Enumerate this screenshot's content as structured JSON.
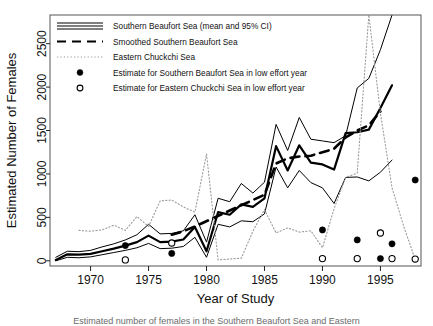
{
  "figure": {
    "title": "",
    "caption_fragment": "Estimated number of females in the Southern Beaufort Sea and Eastern"
  },
  "axes": {
    "xlabel": "Year of Study",
    "ylabel": "Estimated Number of Females",
    "xticks": [
      "1970",
      "1975",
      "1980",
      "1985",
      "1990",
      "1995"
    ],
    "yticks": [
      "0",
      "500",
      "1000",
      "1500",
      "2000",
      "2500"
    ]
  },
  "legend": {
    "items": [
      {
        "label": "Southern Beaufort Sea (mean and 95% CI)",
        "marker": "triple-solid-line",
        "color": "#000000"
      },
      {
        "label": "Smoothed Southern Beaufort Sea",
        "marker": "dashed-line",
        "color": "#000000"
      },
      {
        "label": "Eastern Chuckchi Sea",
        "marker": "dotted-line",
        "color": "#9a9a9a"
      },
      {
        "label": "Estimate for Southern Beaufort Sea in low effort year",
        "marker": "filled-circle",
        "color": "#000000"
      },
      {
        "label": "Estimate for Eastern Chuckchi Sea in low effort year",
        "marker": "open-circle",
        "color": "#000000"
      }
    ]
  },
  "chart_data": {
    "type": "line",
    "title": "",
    "xlabel": "Year of Study",
    "ylabel": "Estimated Number of Females",
    "xlim": [
      1966.5,
      1998.5
    ],
    "ylim": [
      -60,
      2830
    ],
    "xticks": [
      1970,
      1975,
      1980,
      1985,
      1990,
      1995
    ],
    "yticks": [
      0,
      500,
      1000,
      1500,
      2000,
      2500
    ],
    "grid": false,
    "legend_position": "top-left inside",
    "series": [
      {
        "name": "Southern Beaufort Sea (mean)",
        "style": "solid",
        "width": 2.2,
        "color": "#000000",
        "x": [
          1967,
          1968,
          1969,
          1970,
          1971,
          1972,
          1973,
          1974,
          1975,
          1976,
          1977,
          1978,
          1979,
          1980,
          1981,
          1982,
          1983,
          1984,
          1985,
          1986,
          1987,
          1988,
          1989,
          1990,
          1991,
          1992,
          1993,
          1994,
          1995,
          1996
        ],
        "values": [
          10,
          75,
          70,
          80,
          110,
          140,
          175,
          215,
          290,
          215,
          220,
          245,
          390,
          110,
          560,
          530,
          650,
          620,
          720,
          1320,
          1040,
          1330,
          1130,
          1110,
          1050,
          1470,
          1480,
          1510,
          1760,
          2020
        ]
      },
      {
        "name": "Southern Beaufort Sea (upper 95% CI)",
        "style": "solid",
        "width": 1,
        "color": "#000000",
        "x": [
          1967,
          1968,
          1969,
          1970,
          1971,
          1972,
          1973,
          1974,
          1975,
          1976,
          1977,
          1978,
          1979,
          1980,
          1981,
          1982,
          1983,
          1984,
          1985,
          1986,
          1987,
          1988,
          1989,
          1990,
          1991,
          1992,
          1993,
          1994,
          1995,
          1996
        ],
        "values": [
          40,
          110,
          105,
          120,
          160,
          195,
          240,
          300,
          420,
          310,
          315,
          345,
          530,
          215,
          720,
          680,
          890,
          780,
          905,
          1570,
          1270,
          1650,
          1400,
          1380,
          1360,
          1440,
          1990,
          2100,
          2430,
          2830
        ]
      },
      {
        "name": "Southern Beaufort Sea (lower 95% CI)",
        "style": "solid",
        "width": 1,
        "color": "#000000",
        "x": [
          1967,
          1968,
          1969,
          1970,
          1971,
          1972,
          1973,
          1974,
          1975,
          1976,
          1977,
          1978,
          1979,
          1980,
          1981,
          1982,
          1983,
          1984,
          1985,
          1986,
          1987,
          1988,
          1989,
          1990,
          1991,
          1992,
          1993,
          1994,
          1995,
          1996
        ],
        "values": [
          0,
          40,
          35,
          45,
          70,
          95,
          120,
          150,
          200,
          140,
          145,
          165,
          270,
          40,
          420,
          390,
          460,
          450,
          540,
          1080,
          840,
          1040,
          900,
          840,
          660,
          960,
          965,
          920,
          1020,
          1160
        ]
      },
      {
        "name": "Smoothed Southern Beaufort Sea",
        "style": "dashed",
        "width": 2.6,
        "color": "#000000",
        "x": [
          1977,
          1978,
          1979,
          1984,
          1985,
          1986,
          1987,
          1988,
          1989,
          1990,
          1991,
          1992,
          1993,
          1994,
          1995
        ],
        "values": [
          300,
          340,
          395,
          700,
          760,
          1120,
          1180,
          1200,
          1210,
          1250,
          1290,
          1420,
          1500,
          1560,
          1720
        ]
      },
      {
        "name": "Eastern Chuckchi Sea",
        "style": "dotted",
        "width": 1.1,
        "color": "#9a9a9a",
        "x": [
          1969,
          1970,
          1971,
          1972,
          1973,
          1974,
          1975,
          1976,
          1977,
          1978,
          1979,
          1980,
          1981,
          1982,
          1983,
          1984,
          1985,
          1986,
          1987,
          1988,
          1989,
          1990,
          1991,
          1992,
          1993,
          1994,
          1995,
          1996,
          1997,
          1998
        ],
        "values": [
          350,
          340,
          355,
          410,
          350,
          510,
          395,
          690,
          700,
          620,
          560,
          1230,
          10,
          20,
          30,
          340,
          590,
          320,
          380,
          330,
          345,
          150,
          600,
          960,
          1010,
          2830,
          1700,
          840,
          400,
          15
        ]
      }
    ],
    "points": [
      {
        "series": "Estimate for Southern Beaufort Sea in low effort year",
        "marker": "filled-circle",
        "x": 1973,
        "y": 175
      },
      {
        "series": "Estimate for Southern Beaufort Sea in low effort year",
        "marker": "filled-circle",
        "x": 1977,
        "y": 85
      },
      {
        "series": "Estimate for Southern Beaufort Sea in low effort year",
        "marker": "filled-circle",
        "x": 1990,
        "y": 355
      },
      {
        "series": "Estimate for Southern Beaufort Sea in low effort year",
        "marker": "filled-circle",
        "x": 1993,
        "y": 240
      },
      {
        "series": "Estimate for Southern Beaufort Sea in low effort year",
        "marker": "filled-circle",
        "x": 1995,
        "y": 25
      },
      {
        "series": "Estimate for Southern Beaufort Sea in low effort year",
        "marker": "filled-circle",
        "x": 1996,
        "y": 195
      },
      {
        "series": "Estimate for Southern Beaufort Sea in low effort year",
        "marker": "filled-circle",
        "x": 1998,
        "y": 930
      },
      {
        "series": "Estimate for Eastern Chuckchi Sea in low effort year",
        "marker": "open-circle",
        "x": 1973,
        "y": 10
      },
      {
        "series": "Estimate for Eastern Chuckchi Sea in low effort year",
        "marker": "open-circle",
        "x": 1977,
        "y": 205
      },
      {
        "series": "Estimate for Eastern Chuckchi Sea in low effort year",
        "marker": "open-circle",
        "x": 1990,
        "y": 25
      },
      {
        "series": "Estimate for Eastern Chuckchi Sea in low effort year",
        "marker": "open-circle",
        "x": 1993,
        "y": 25
      },
      {
        "series": "Estimate for Eastern Chuckchi Sea in low effort year",
        "marker": "open-circle",
        "x": 1995,
        "y": 320
      },
      {
        "series": "Estimate for Eastern Chuckchi Sea in low effort year",
        "marker": "open-circle",
        "x": 1996,
        "y": 25
      },
      {
        "series": "Estimate for Eastern Chuckchi Sea in low effort year",
        "marker": "open-circle",
        "x": 1998,
        "y": 20
      }
    ]
  }
}
